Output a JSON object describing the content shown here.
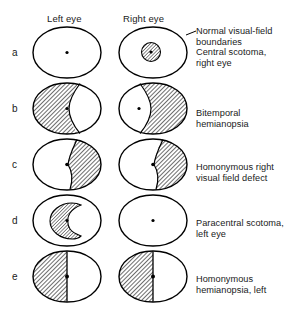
{
  "figure": {
    "columns": [
      {
        "key": "left",
        "label": "Left eye"
      },
      {
        "key": "right",
        "label": "Right eye"
      }
    ],
    "annotation_leader": {
      "label": "leader-line-to-normal-boundary"
    },
    "rows": [
      {
        "letter": "a",
        "caption": "Normal visual-field\nboundaries\nCentral scotoma,\nright eye",
        "left": {
          "defect": "none",
          "fixation_dot": true
        },
        "right": {
          "defect": "central-scotoma",
          "fixation_dot": true
        }
      },
      {
        "letter": "b",
        "caption": "Bitemporal\nhemianopsia",
        "left": {
          "defect": "temporal-half-left-side",
          "fixation_dot": true
        },
        "right": {
          "defect": "temporal-half-right-side",
          "fixation_dot": true
        }
      },
      {
        "letter": "c",
        "caption": "Homonymous right\nvisual field defect",
        "left": {
          "defect": "right-half-curved",
          "fixation_dot": true
        },
        "right": {
          "defect": "right-half-curved",
          "fixation_dot": true
        }
      },
      {
        "letter": "d",
        "caption": "Paracentral scotoma,\nleft eye",
        "left": {
          "defect": "paracentral-c-shaped-scotoma",
          "fixation_dot": true
        },
        "right": {
          "defect": "none",
          "fixation_dot": true
        }
      },
      {
        "letter": "e",
        "caption": "Homonymous\nhemianopsia, left",
        "left": {
          "defect": "left-half-straight",
          "fixation_dot": true
        },
        "right": {
          "defect": "left-half-straight",
          "fixation_dot": true
        }
      }
    ],
    "colors": {
      "outline": "#000000",
      "hatch": "#4a4a4a",
      "background": "#ffffff",
      "text": "#1a1a1a"
    }
  }
}
